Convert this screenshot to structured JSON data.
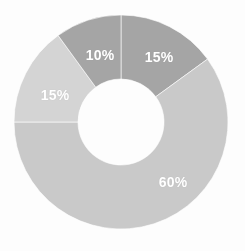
{
  "chart_data": {
    "type": "pie",
    "variant": "donut",
    "title": "",
    "subtitle": "",
    "xlabel": "",
    "ylabel": "",
    "grid": false,
    "legend": "none",
    "units": "percent",
    "total": 100,
    "start_angle_deg": 0,
    "direction": "clockwise",
    "center": {
      "x": 121,
      "y": 122
    },
    "outer_radius": 107,
    "inner_radius": 43,
    "background_color": "#fdfdfd",
    "label_color": "#ffffff",
    "categories": [
      "Segment 1",
      "Segment 2",
      "Segment 3",
      "Segment 4"
    ],
    "values": [
      15,
      60,
      15,
      10
    ],
    "labels": [
      "15%",
      "60%",
      "15%",
      "10%"
    ],
    "colors": [
      "#a5a5a5",
      "#c9c9c9",
      "#d4d4d4",
      "#a5a5a5"
    ],
    "slices": [
      {
        "label": "15%",
        "value": 15,
        "color": "#a5a5a5",
        "start_deg": 0,
        "end_deg": 54,
        "label_x": 159,
        "label_y": 57
      },
      {
        "label": "60%",
        "value": 60,
        "color": "#c9c9c9",
        "start_deg": 54,
        "end_deg": 270,
        "label_x": 173,
        "label_y": 182
      },
      {
        "label": "15%",
        "value": 15,
        "color": "#d4d4d4",
        "start_deg": 270,
        "end_deg": 324,
        "label_x": 55,
        "label_y": 95
      },
      {
        "label": "10%",
        "value": 10,
        "color": "#a5a5a5",
        "start_deg": 324,
        "end_deg": 360,
        "label_x": 100,
        "label_y": 55
      }
    ]
  }
}
